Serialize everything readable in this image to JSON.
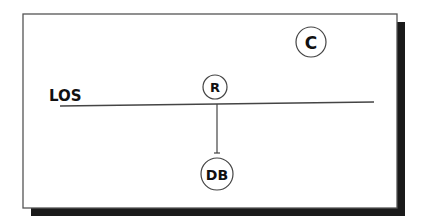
{
  "diagram": {
    "colors": {
      "background": "#ffffff",
      "frame_border": "#555555",
      "shadow": "#1a1a1a",
      "line": "#444444",
      "text": "#111111"
    },
    "line_label": "LOS",
    "nodes": [
      {
        "id": "C",
        "label": "C"
      },
      {
        "id": "R",
        "label": "R"
      },
      {
        "id": "DB",
        "label": "DB"
      }
    ],
    "edges": [
      {
        "from": "R",
        "to": "DB"
      }
    ]
  }
}
